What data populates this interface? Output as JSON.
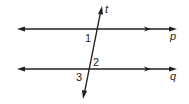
{
  "diagram": {
    "lines": [
      {
        "name": "p",
        "label": "p"
      },
      {
        "name": "q",
        "label": "q"
      },
      {
        "name": "t",
        "label": "t"
      }
    ],
    "angles": [
      {
        "label": "1"
      },
      {
        "label": "2"
      },
      {
        "label": "3"
      }
    ],
    "color": "#231f20"
  }
}
